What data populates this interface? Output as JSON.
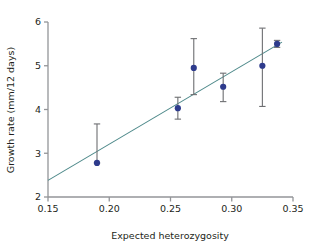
{
  "chart_data": {
    "type": "scatter",
    "title": "",
    "subtitle": "",
    "xlabel": "Expected heterozygosity",
    "ylabel": "Growth rate (mm/12 days)",
    "xlim": [
      0.15,
      0.35
    ],
    "ylim": [
      2,
      6
    ],
    "xticks": [
      0.15,
      0.2,
      0.25,
      0.3,
      0.35
    ],
    "xtick_labels": [
      "0.15",
      "0.20",
      "0.25",
      "0.30",
      "0.35"
    ],
    "yticks": [
      2,
      3,
      4,
      5,
      6
    ],
    "ytick_labels": [
      "2",
      "3",
      "4",
      "5",
      "6"
    ],
    "grid": false,
    "legend": null,
    "marker_color": "#2e3b8c",
    "errorbar_color": "#6d6e71",
    "trendline_color": "#4f8a8b",
    "axis_color": "#939598",
    "points": [
      {
        "x": 0.19,
        "y": 2.78,
        "yerr_low": 2.78,
        "yerr_high": 3.67
      },
      {
        "x": 0.256,
        "y": 4.03,
        "yerr_low": 3.78,
        "yerr_high": 4.28
      },
      {
        "x": 0.269,
        "y": 4.95,
        "yerr_low": 4.34,
        "yerr_high": 5.62
      },
      {
        "x": 0.293,
        "y": 4.52,
        "yerr_low": 4.18,
        "yerr_high": 4.83
      },
      {
        "x": 0.325,
        "y": 5.0,
        "yerr_low": 4.07,
        "yerr_high": 5.86
      },
      {
        "x": 0.337,
        "y": 5.5,
        "yerr_low": 5.42,
        "yerr_high": 5.58
      }
    ],
    "trendline": {
      "x_start": 0.15,
      "y_start": 2.38,
      "x_end": 0.341,
      "y_end": 5.54
    }
  }
}
